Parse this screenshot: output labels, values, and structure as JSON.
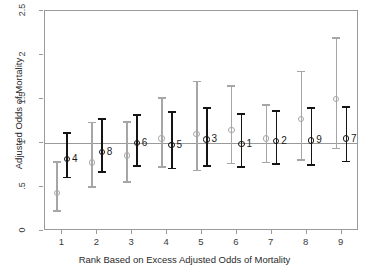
{
  "chart_data": {
    "type": "scatter",
    "title": "",
    "xlabel": "Rank Based on Excess Adjusted Odds of Mortality",
    "ylabel": "Adjusted Odds of Mortality",
    "xlim": [
      0.5,
      9.5
    ],
    "ylim": [
      0,
      2.5
    ],
    "yticks": [
      "0",
      ".5",
      "1",
      "1.5",
      "2",
      "2.5"
    ],
    "ytick_values": [
      0,
      0.5,
      1,
      1.5,
      2,
      2.5
    ],
    "xticks": [
      "1",
      "2",
      "3",
      "4",
      "5",
      "6",
      "7",
      "8",
      "9"
    ],
    "xtick_values": [
      1,
      2,
      3,
      4,
      5,
      6,
      7,
      8,
      9
    ],
    "grid": false,
    "legend": "none",
    "reference_line": 1,
    "series": [
      {
        "name": "unadjusted",
        "color": "#a6a6a6",
        "marker": "open-circle",
        "x": [
          1,
          2,
          3,
          4,
          5,
          6,
          7,
          8,
          9
        ],
        "values": [
          0.43,
          0.78,
          0.86,
          1.05,
          1.1,
          1.15,
          1.05,
          1.27,
          1.5
        ],
        "ci_low": [
          0.22,
          0.49,
          0.55,
          0.72,
          0.68,
          0.76,
          0.77,
          0.8,
          0.93
        ],
        "ci_high": [
          0.79,
          1.24,
          1.25,
          1.52,
          1.71,
          1.66,
          1.44,
          1.82,
          2.2
        ]
      },
      {
        "name": "adjusted",
        "color": "#141414",
        "marker": "open-circle",
        "x": [
          1,
          2,
          3,
          4,
          5,
          6,
          7,
          8,
          9
        ],
        "values": [
          0.82,
          0.9,
          1.0,
          0.98,
          1.04,
          0.99,
          1.02,
          1.03,
          1.05
        ],
        "ci_low": [
          0.6,
          0.66,
          0.73,
          0.7,
          0.73,
          0.72,
          0.75,
          0.74,
          0.78
        ],
        "ci_high": [
          1.12,
          1.28,
          1.33,
          1.36,
          1.41,
          1.34,
          1.37,
          1.41,
          1.42
        ],
        "point_labels": [
          "4",
          "8",
          "6",
          "5",
          "3",
          "1",
          "2",
          "9",
          "7"
        ]
      }
    ]
  }
}
